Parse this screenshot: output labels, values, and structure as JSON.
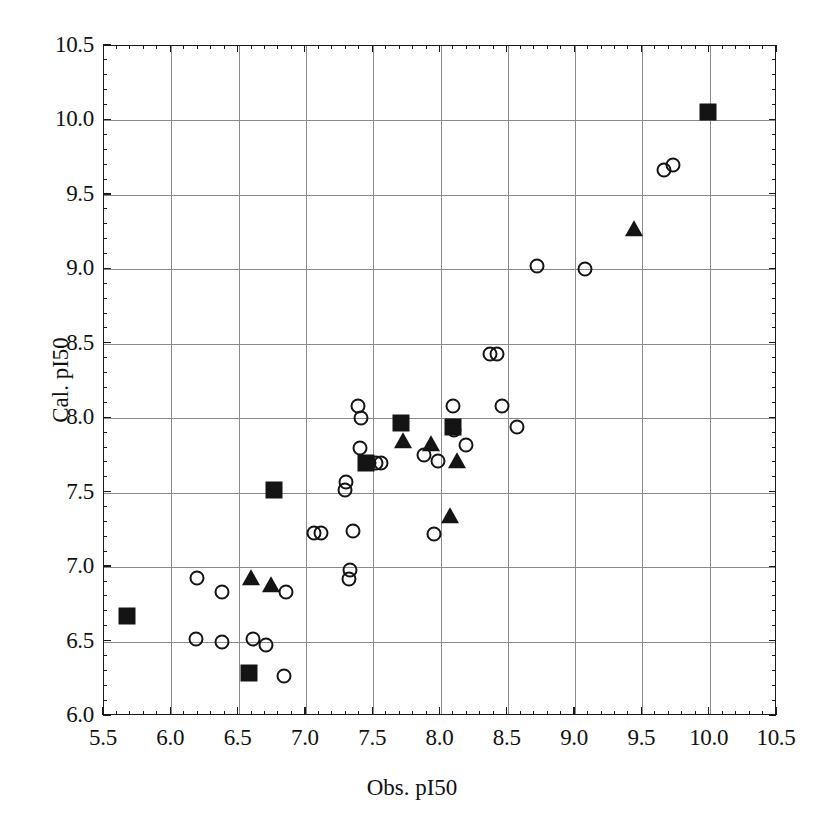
{
  "chart_data": {
    "type": "scatter",
    "title": "",
    "xlabel": "Obs. pI50",
    "ylabel": "Cal. pI50",
    "xlim": [
      5.5,
      10.5
    ],
    "ylim": [
      6.0,
      10.5
    ],
    "xticks": [
      "5.5",
      "6.0",
      "6.5",
      "7.0",
      "7.5",
      "8.0",
      "8.5",
      "9.0",
      "9.5",
      "10.0",
      "10.5"
    ],
    "yticks": [
      "6.0",
      "6.5",
      "7.0",
      "7.5",
      "8.0",
      "8.5",
      "9.0",
      "9.5",
      "10.0",
      "10.5"
    ],
    "grid": true,
    "legend": "none",
    "marker_color": "#141414",
    "series": [
      {
        "name": "open-circle",
        "marker": "circle-open",
        "points": [
          [
            6.19,
            6.93
          ],
          [
            6.38,
            6.83
          ],
          [
            6.18,
            6.52
          ],
          [
            6.38,
            6.5
          ],
          [
            6.61,
            6.52
          ],
          [
            6.7,
            6.48
          ],
          [
            6.85,
            6.83
          ],
          [
            6.84,
            6.27
          ],
          [
            7.06,
            7.23
          ],
          [
            7.11,
            7.23
          ],
          [
            7.29,
            7.52
          ],
          [
            7.3,
            7.57
          ],
          [
            7.33,
            6.98
          ],
          [
            7.32,
            6.92
          ],
          [
            7.35,
            7.24
          ],
          [
            7.39,
            8.08
          ],
          [
            7.41,
            8.0
          ],
          [
            7.4,
            7.8
          ],
          [
            7.47,
            7.7
          ],
          [
            7.52,
            7.7
          ],
          [
            7.56,
            7.7
          ],
          [
            7.88,
            7.75
          ],
          [
            7.98,
            7.71
          ],
          [
            7.95,
            7.22
          ],
          [
            8.09,
            8.08
          ],
          [
            8.1,
            7.92
          ],
          [
            8.19,
            7.82
          ],
          [
            8.37,
            8.43
          ],
          [
            8.42,
            8.43
          ],
          [
            8.46,
            8.08
          ],
          [
            8.57,
            7.94
          ],
          [
            8.72,
            9.02
          ],
          [
            9.07,
            9.0
          ],
          [
            9.66,
            9.67
          ],
          [
            9.73,
            9.7
          ]
        ]
      },
      {
        "name": "filled-square",
        "marker": "square-filled",
        "points": [
          [
            5.67,
            6.67
          ],
          [
            6.58,
            6.29
          ],
          [
            6.76,
            7.52
          ],
          [
            7.45,
            7.7
          ],
          [
            7.71,
            7.97
          ],
          [
            8.09,
            7.94
          ],
          [
            9.99,
            10.06
          ]
        ]
      },
      {
        "name": "filled-triangle",
        "marker": "triangle-filled",
        "points": [
          [
            6.59,
            6.93
          ],
          [
            6.74,
            6.88
          ],
          [
            7.72,
            7.85
          ],
          [
            7.93,
            7.83
          ],
          [
            8.12,
            7.71
          ],
          [
            8.07,
            7.34
          ],
          [
            9.44,
            9.27
          ]
        ]
      }
    ]
  },
  "axes": {
    "x_title": "Obs. pI50",
    "y_title": "Cal. pI50",
    "x_tick_labels": [
      "5.5",
      "6.0",
      "6.5",
      "7.0",
      "7.5",
      "8.0",
      "8.5",
      "9.0",
      "9.5",
      "10.0",
      "10.5"
    ],
    "y_tick_labels": [
      "6.0",
      "6.5",
      "7.0",
      "7.5",
      "8.0",
      "8.5",
      "9.0",
      "9.5",
      "10.0",
      "10.5"
    ]
  }
}
